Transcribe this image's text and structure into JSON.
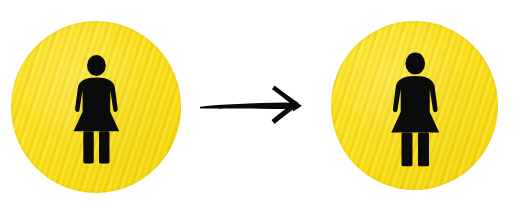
{
  "scene": {
    "title": "Female restroom pictogram sticker transformation",
    "background_color": "#ffffff",
    "width": 518,
    "height": 212
  },
  "colors": {
    "sticker_yellow": "#FBE21C",
    "sticker_yellow_dark": "#F2D411",
    "pictogram_black": "#0B0B0B",
    "arrow_black": "#0A0A0A",
    "background_white": "#FFFFFF"
  },
  "items": [
    {
      "id": "sticker-left",
      "label": "Yellow circular sticker with female restroom pictogram",
      "shape": "circle",
      "fill": "#FBE21C",
      "texture": "diagonal-stripes",
      "icon": "female-restroom-icon",
      "icon_color": "#0B0B0B",
      "icon_scale": "small"
    },
    {
      "id": "arrow",
      "label": "Hand-drawn arrow pointing right",
      "shape": "arrow",
      "direction": "right",
      "color": "#0A0A0A",
      "icon": "arrow-right-icon"
    },
    {
      "id": "sticker-right",
      "label": "Yellow circular sticker with enlarged female restroom pictogram",
      "shape": "circle",
      "fill": "#FBE21C",
      "texture": "diagonal-stripes",
      "icon": "female-restroom-icon",
      "icon_color": "#0B0B0B",
      "icon_scale": "large"
    }
  ]
}
